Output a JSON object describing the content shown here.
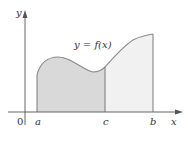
{
  "figure": {
    "type": "area-under-curve",
    "function_label": "y = f(x)",
    "axis_labels": {
      "x": "x",
      "y": "y"
    },
    "origin_label": "0",
    "points": [
      {
        "name": "a",
        "label": "a"
      },
      {
        "name": "c",
        "label": "c"
      },
      {
        "name": "b",
        "label": "b"
      }
    ],
    "regions": [
      {
        "name": "a-to-c",
        "from": "a",
        "to": "c",
        "fill": "#d9d9d9"
      },
      {
        "name": "c-to-b",
        "from": "c",
        "to": "b",
        "fill": "#f1f1f1"
      }
    ],
    "colors": {
      "axis": "#555555",
      "curve": "#8a8a8a",
      "divider": "#6e6e6e",
      "dark_region": "#d9d9d9",
      "light_region": "#f1f1f1"
    }
  }
}
